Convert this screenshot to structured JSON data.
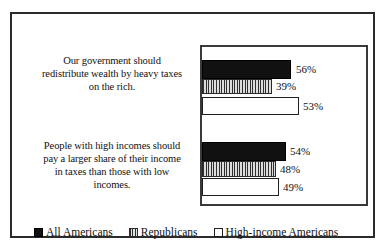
{
  "chart_data": {
    "type": "bar",
    "orientation": "horizontal",
    "title": "",
    "subtitle": "",
    "xlabel": "",
    "ylabel": "",
    "grid": false,
    "legend_position": "bottom-left",
    "categories": [
      "Our government should redistribute wealth by heavy taxes on the rich.",
      "People with high incomes should pay a larger share of their income in taxes than those with low incomes."
    ],
    "category_lines": [
      [
        "Our government should",
        "redistribute wealth by heavy taxes",
        "on the rich."
      ],
      [
        "People with high incomes should",
        "pay a larger share of their income",
        "in taxes than those with low",
        "incomes."
      ]
    ],
    "series": [
      {
        "name": "All Americans",
        "fill": "solid-black",
        "color": "#111111",
        "values": [
          56,
          48
        ],
        "labels": [
          "56%",
          "54%"
        ]
      },
      {
        "name": "Republicans",
        "fill": "vertical-hatch",
        "color": "#c9c9c9",
        "values": [
          39,
          48
        ],
        "labels": [
          "39%",
          "48%"
        ]
      },
      {
        "name": "High-income Americans",
        "fill": "white",
        "color": "#ffffff",
        "values": [
          53,
          49
        ],
        "labels": [
          "53%",
          "49%"
        ]
      }
    ],
    "bars": [
      {
        "group": 0,
        "series": "All Americans",
        "label": "56%",
        "value": 56,
        "px_left": 0,
        "px_top": 13,
        "px_width": 89,
        "px_height": 19,
        "label_left": 94,
        "label_top": 17
      },
      {
        "group": 0,
        "series": "Republicans",
        "label": "39%",
        "value": 39,
        "px_left": 0,
        "px_top": 32,
        "px_width": 70,
        "px_height": 15,
        "label_left": 74,
        "label_top": 34
      },
      {
        "group": 0,
        "series": "High-income Americans",
        "label": "53%",
        "value": 53,
        "px_left": 0,
        "px_top": 50,
        "px_width": 97,
        "px_height": 18,
        "label_left": 101,
        "label_top": 54
      },
      {
        "group": 1,
        "series": "All Americans",
        "label": "54%",
        "value": 54,
        "px_left": 0,
        "px_top": 95,
        "px_width": 84,
        "px_height": 19,
        "label_left": 88,
        "label_top": 99
      },
      {
        "group": 1,
        "series": "Republicans",
        "label": "48%",
        "value": 48,
        "px_left": 0,
        "px_top": 114,
        "px_width": 74,
        "px_height": 16,
        "label_left": 78,
        "label_top": 117
      },
      {
        "group": 1,
        "series": "High-income Americans",
        "label": "49%",
        "value": 49,
        "px_left": 0,
        "px_top": 131,
        "px_width": 77,
        "px_height": 18,
        "label_left": 81,
        "label_top": 135
      }
    ]
  },
  "legend": {
    "items": [
      {
        "label": "All Americans"
      },
      {
        "label": "Republicans"
      },
      {
        "label": "High-income Americans"
      }
    ]
  }
}
